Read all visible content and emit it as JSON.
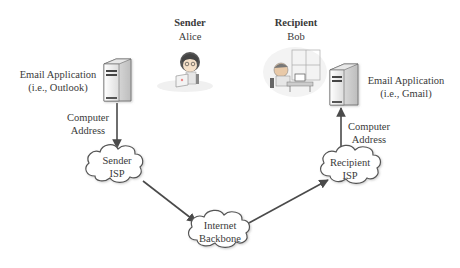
{
  "sender": {
    "role": "Sender",
    "name": "Alice"
  },
  "recipient": {
    "role": "Recipient",
    "name": "Bob"
  },
  "sender_app": {
    "line1": "Email Application",
    "line2": "(i.e., Outlook)"
  },
  "recipient_app": {
    "line1": "Email Application",
    "line2": "(i.e., Gmail)"
  },
  "sender_address": {
    "line1": "Computer",
    "line2": "Address"
  },
  "recipient_address": {
    "line1": "Computer",
    "line2": "Address"
  },
  "clouds": {
    "sender_isp": {
      "line1": "Sender",
      "line2": "ISP"
    },
    "backbone": {
      "line1": "Internet",
      "line2": "Backbone"
    },
    "recipient_isp": {
      "line1": "Recipient",
      "line2": "ISP"
    }
  },
  "icons": {
    "sender_server": "server-tower-icon",
    "recipient_server": "server-tower-icon",
    "alice": "person-at-laptop-illustration",
    "bob": "person-at-desk-illustration"
  },
  "colors": {
    "line": "#4a4a4a",
    "cloud_fill": "#ffffff",
    "cloud_stroke": "#555555",
    "text": "#3a3a3a"
  }
}
